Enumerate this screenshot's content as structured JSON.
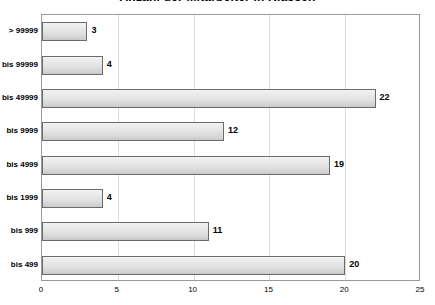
{
  "chart_data": {
    "type": "bar",
    "orientation": "horizontal",
    "title": "Anzahl der Mitarbeiter in Klassen",
    "xlabel": "",
    "ylabel": "",
    "xlim": [
      0,
      25
    ],
    "xticks": [
      0,
      5,
      10,
      15,
      20,
      25
    ],
    "xtick_labels": [
      "0",
      "5",
      "10",
      "15",
      "20",
      "25"
    ],
    "grid": true,
    "grid_axis": "x",
    "legend": false,
    "categories": [
      "> 99999",
      "bis 99999",
      "bis 49999",
      "bis 9999",
      "bis 4999",
      "bis 1999",
      "bis 999",
      "bis 499"
    ],
    "values": [
      3,
      4,
      22,
      12,
      19,
      4,
      11,
      20
    ],
    "value_labels": [
      "3",
      "4",
      "22",
      "12",
      "19",
      "4",
      "11",
      "20"
    ],
    "colors": {
      "bar_fill_light": "#f2f2f2",
      "bar_fill_dark": "#c9c9c9",
      "bar_border": "#6b6b6b",
      "gridline": "#dcdcdc",
      "axis_border": "#9a9a9a",
      "text": "#000000",
      "background": "#ffffff"
    }
  }
}
